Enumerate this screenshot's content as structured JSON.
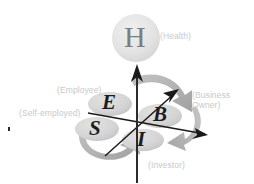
{
  "diagram": {
    "background_color": "#ffffff",
    "label_color": "#c9c9c9",
    "letter_color": "#1c1c1c",
    "ellipse_color": "#d6d6d6",
    "arrow_gray": "#b5b5b5",
    "axis_color": "#1a1a1a",
    "health": {
      "letter": "H",
      "label": "(Health)",
      "circle_color": "#e4e4e4",
      "letter_color": "#7d7d7d"
    },
    "quadrants": [
      {
        "key": "employee",
        "letter": "E",
        "label": "(Employee)"
      },
      {
        "key": "business",
        "letter": "B",
        "label_line1": "(Business",
        "label_line2": "Owner)"
      },
      {
        "key": "selfemployed",
        "letter": "S",
        "label": "(Self-employed)"
      },
      {
        "key": "investor",
        "letter": "I",
        "label": "(Investor)"
      }
    ],
    "axes": {
      "vertical_label": "",
      "horizontal_label": "",
      "diagonal_label": ""
    }
  }
}
